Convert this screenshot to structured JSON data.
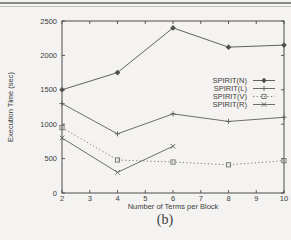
{
  "page": {
    "background": "#f4f3f1",
    "top_rules": {
      "dark_color": "#888885",
      "light_color": "#c2c1bd"
    }
  },
  "chart_data": {
    "type": "line",
    "title": "",
    "caption": "(b)",
    "xlabel": "Number of Terms per Block",
    "ylabel": "Execution Time (sec)",
    "xlim": [
      2,
      10
    ],
    "ylim": [
      0,
      2500
    ],
    "xticks": [
      2,
      3,
      4,
      5,
      6,
      7,
      8,
      9,
      10
    ],
    "yticks": [
      0,
      500,
      1000,
      1500,
      2000,
      2500
    ],
    "grid": false,
    "legend_position": "inside-right-middle",
    "axis_color": "#4c4c4a",
    "text_color": "#3d3d3b",
    "series": [
      {
        "name": "SPIRIT(N)",
        "marker": "diamond",
        "line_style": "solid",
        "color": "#4f4f4d",
        "x": [
          2,
          4,
          6,
          8,
          10
        ],
        "y": [
          1500,
          1750,
          2400,
          2120,
          2150
        ]
      },
      {
        "name": "SPIRIT(L)",
        "marker": "plus",
        "line_style": "solid",
        "color": "#5c5c5a",
        "x": [
          2,
          4,
          6,
          8,
          10
        ],
        "y": [
          1300,
          860,
          1150,
          1040,
          1100
        ]
      },
      {
        "name": "SPIRIT(V)",
        "marker": "square-open",
        "line_style": "dotted",
        "color": "#6e6e6c",
        "x": [
          2,
          4,
          6,
          8,
          10
        ],
        "y": [
          950,
          480,
          450,
          410,
          470
        ]
      },
      {
        "name": "SPIRIT(R)",
        "marker": "cross",
        "line_style": "solid",
        "color": "#5f5f5d",
        "x": [
          2,
          4,
          6
        ],
        "y": [
          800,
          300,
          680
        ]
      }
    ]
  }
}
